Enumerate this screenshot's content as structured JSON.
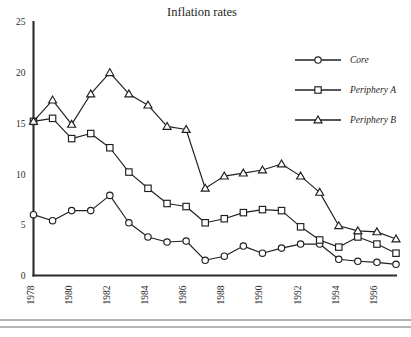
{
  "chart_data": {
    "type": "line",
    "title": "Inflation rates",
    "xlabel": "",
    "ylabel": "",
    "xlim": [
      1978,
      1997
    ],
    "ylim": [
      0,
      25
    ],
    "ytick_values": [
      0,
      5,
      10,
      15,
      20,
      25
    ],
    "ytick_labels": [
      "0",
      "5",
      "10",
      "15",
      "20",
      "25"
    ],
    "xtick_values": [
      1978,
      1980,
      1982,
      1984,
      1986,
      1988,
      1990,
      1992,
      1994,
      1996
    ],
    "xtick_labels": [
      "1978",
      "1980",
      "1982",
      "1984",
      "1986",
      "1988",
      "1990",
      "1992",
      "1994",
      "1996"
    ],
    "x": [
      1978,
      1979,
      1980,
      1981,
      1982,
      1983,
      1984,
      1985,
      1986,
      1987,
      1988,
      1989,
      1990,
      1991,
      1992,
      1993,
      1994,
      1995,
      1996,
      1997
    ],
    "grid": false,
    "legend_position": "top-right",
    "series": [
      {
        "name": "Core",
        "marker": "circle",
        "values": [
          6.0,
          5.4,
          6.4,
          6.4,
          7.9,
          5.2,
          3.8,
          3.3,
          3.4,
          1.5,
          1.9,
          2.9,
          2.2,
          2.7,
          3.1,
          3.1,
          1.6,
          1.4,
          1.3,
          1.1
        ]
      },
      {
        "name": "Periphery A",
        "marker": "square",
        "values": [
          15.2,
          15.5,
          13.5,
          14.0,
          12.6,
          10.2,
          8.6,
          7.1,
          6.8,
          5.2,
          5.6,
          6.2,
          6.5,
          6.4,
          4.8,
          3.5,
          2.8,
          3.8,
          3.1,
          2.2
        ]
      },
      {
        "name": "Periphery B",
        "marker": "triangle",
        "values": [
          15.2,
          17.3,
          14.9,
          17.9,
          20.0,
          17.9,
          16.8,
          14.7,
          14.4,
          8.6,
          9.8,
          10.1,
          10.4,
          11.0,
          9.8,
          8.2,
          4.9,
          4.4,
          4.3,
          3.6
        ]
      }
    ]
  },
  "colors": {
    "line": "#1f1f1f",
    "axis": "#2b2b2b",
    "marker_fill": "#ffffff",
    "background": "#ffffff",
    "footer_rule": "#6a6a6a"
  },
  "footer": {
    "rules": 2
  }
}
